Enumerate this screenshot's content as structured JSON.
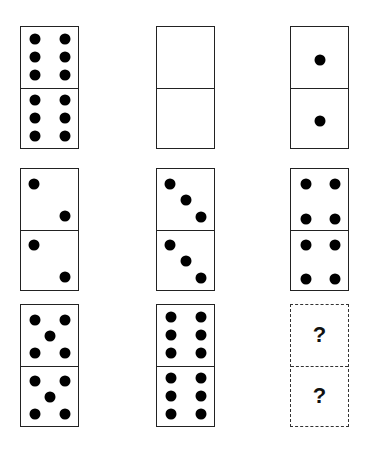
{
  "puzzle": {
    "rows": 3,
    "cols": 3,
    "dominoes": [
      {
        "id": "r1c1",
        "left": 20,
        "top": 26,
        "top_pips": 6,
        "bottom_pips": 6
      },
      {
        "id": "r1c2",
        "left": 156,
        "top": 26,
        "top_pips": 0,
        "bottom_pips": 0
      },
      {
        "id": "r1c3",
        "left": 290,
        "top": 26,
        "top_pips": 1,
        "bottom_pips": 1
      },
      {
        "id": "r2c1",
        "left": 20,
        "top": 168,
        "top_pips": 2,
        "bottom_pips": 2
      },
      {
        "id": "r2c2",
        "left": 156,
        "top": 168,
        "top_pips": 3,
        "bottom_pips": 3
      },
      {
        "id": "r2c3",
        "left": 290,
        "top": 168,
        "top_pips": 4,
        "bottom_pips": 4
      },
      {
        "id": "r3c1",
        "left": 20,
        "top": 304,
        "top_pips": 5,
        "bottom_pips": 5
      },
      {
        "id": "r3c2",
        "left": 156,
        "top": 304,
        "top_pips": 6,
        "bottom_pips": 6
      },
      {
        "id": "r3c3",
        "left": 290,
        "top": 304,
        "unknown": true,
        "top_label": "?",
        "bottom_label": "?"
      }
    ]
  }
}
